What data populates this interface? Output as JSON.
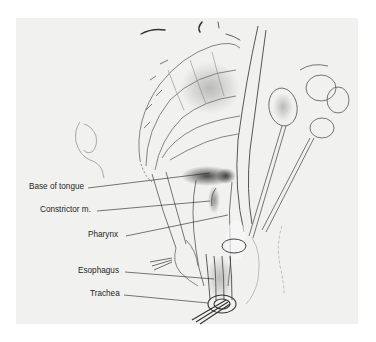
{
  "figure": {
    "style": "pencil anatomical illustration",
    "colors": {
      "background": "#ffffff",
      "panel": "#f1f1f0",
      "ink": "#1e1e1e",
      "shading": "#6a6a6a"
    }
  },
  "labels": [
    {
      "id": "base-of-tongue",
      "text": "Base of tongue",
      "x": 29,
      "y": 182,
      "w": 57,
      "line": [
        88,
        188,
        210,
        173
      ]
    },
    {
      "id": "constrictor",
      "text": "Constrictor m.",
      "x": 40,
      "y": 205,
      "w": 56,
      "line": [
        97,
        211,
        210,
        201
      ]
    },
    {
      "id": "pharynx",
      "text": "Pharynx",
      "x": 86,
      "y": 230,
      "w": 38,
      "line": [
        126,
        236,
        228,
        215
      ]
    },
    {
      "id": "esophagus",
      "text": "Esophagus",
      "x": 78,
      "y": 266,
      "w": 45,
      "line": [
        125,
        272,
        214,
        279
      ]
    },
    {
      "id": "trachea",
      "text": "Trachea",
      "x": 90,
      "y": 289,
      "w": 33,
      "line": [
        124,
        295,
        208,
        303
      ]
    }
  ]
}
